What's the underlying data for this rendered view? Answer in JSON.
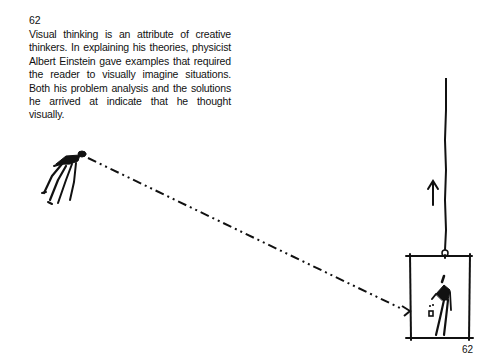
{
  "page": {
    "number_top": "62",
    "number_bottom": "62",
    "caption": "Visual thinking is an attribute of creative thinkers. In explaining his theories, physicist Albert Einstein gave examples that required the reader to visually imagine situations. Both his problem analysis and the solutions he arrived at indicate that he thought visually."
  },
  "illustration": {
    "elements": [
      "floating-figure",
      "dash-dot-light-path",
      "rope",
      "up-arrow",
      "elevator-box",
      "figure-in-elevator",
      "dropped-object"
    ],
    "ink_color": "#111111"
  }
}
